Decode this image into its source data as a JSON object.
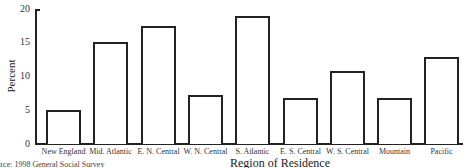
{
  "chart_data": {
    "type": "bar",
    "title": "",
    "xlabel": "Region of Residence",
    "ylabel": "Percent",
    "ylim": [
      0,
      20
    ],
    "yticks": [
      0,
      5,
      10,
      15,
      20
    ],
    "grid": false,
    "legend": null,
    "categories": [
      "New England",
      "Mid. Atlantic",
      "E. N. Central",
      "W. N. Central",
      "S. Atlantic",
      "E. S. Central",
      "W. S. Central",
      "Mountain",
      "Pacific"
    ],
    "values": [
      5.0,
      15.1,
      17.5,
      7.3,
      19.0,
      6.8,
      10.8,
      6.8,
      12.9
    ],
    "source": "Source: 1998 General Social Survey"
  },
  "labels": {
    "y0": "0",
    "y5": "5",
    "y10": "10",
    "y15": "15",
    "y20": "20"
  }
}
